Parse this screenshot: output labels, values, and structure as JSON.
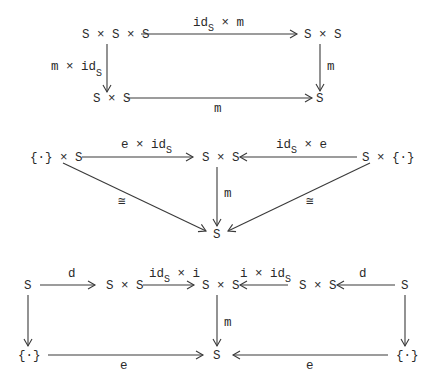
{
  "diagrams": [
    {
      "name": "associativity",
      "nodes": {
        "top_left": "S × S × S",
        "top_right": "S × S",
        "bottom_left": "S × S",
        "bottom_right": "S"
      },
      "arrows": {
        "top": {
          "main": "id",
          "sub": "S",
          "rest": " × m"
        },
        "left": {
          "main": "m × id",
          "sub": "S"
        },
        "right": "m",
        "bottom": "m"
      }
    },
    {
      "name": "identity",
      "nodes": {
        "left": "{·} × S",
        "center": "S × S",
        "right": "S × {·}",
        "bottom": "S"
      },
      "arrows": {
        "left_to_center": {
          "main": "e × id",
          "sub": "S"
        },
        "right_to_center": {
          "main": "id",
          "sub": "S",
          "rest": " × e"
        },
        "center_down": "m",
        "left_diag": "≅",
        "right_diag": "≅"
      }
    },
    {
      "name": "inverse",
      "nodes": {
        "s_left": "S",
        "sxs_left": "S × S",
        "sxs_center": "S × S",
        "sxs_right": "S × S",
        "s_right": "S",
        "point_left": "{·}",
        "s_bottom": "S",
        "point_right": "{·}"
      },
      "arrows": {
        "d_left": "d",
        "id_x_i": {
          "main": "id",
          "sub": "S",
          "rest": " × i"
        },
        "i_x_id": {
          "main": "i × id",
          "sub": "S"
        },
        "d_right": "d",
        "center_down": "m",
        "e_left": "e",
        "e_right": "e"
      }
    }
  ]
}
